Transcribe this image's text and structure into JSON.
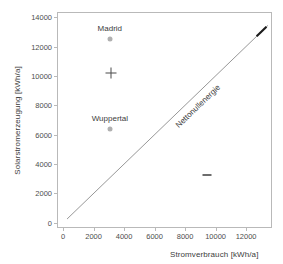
{
  "chart_data": {
    "type": "scatter",
    "title": "",
    "xlabel": "Stromverbrauch [kWh/a]",
    "ylabel": "Solarstromerzeugung [kWh/a]",
    "xlim": [
      -400,
      13700
    ],
    "ylim": [
      -350,
      14350
    ],
    "xticks": [
      0,
      2000,
      4000,
      6000,
      8000,
      10000,
      12000
    ],
    "yticks": [
      0,
      2000,
      4000,
      6000,
      8000,
      10000,
      12000,
      14000
    ],
    "xtick_labels": [
      "0",
      "2000",
      "4000",
      "6000",
      "8000",
      "10000",
      "12000"
    ],
    "ytick_labels": [
      "0",
      "2000",
      "4000",
      "6000",
      "8000",
      "10000",
      "12000",
      "14000"
    ],
    "grid": false,
    "legend": null,
    "points": [
      {
        "name": "madrid",
        "label": "Madrid",
        "x": 3000,
        "y": 12560,
        "marker": "circle",
        "color": "#b0b0b0",
        "label_dx": 0,
        "label_dy": -6
      },
      {
        "name": "unlabeled-plus",
        "label": "",
        "x": 3050,
        "y": 10240,
        "marker": "plus",
        "color": "#4a4a4a",
        "label_dx": 0,
        "label_dy": 0
      },
      {
        "name": "wuppertal",
        "label": "Wuppertal",
        "x": 3000,
        "y": 6450,
        "marker": "circle",
        "color": "#b0b0b0",
        "label_dx": 0,
        "label_dy": -6
      },
      {
        "name": "unlabeled-dash",
        "label": "",
        "x": 9400,
        "y": 3320,
        "marker": "dash",
        "color": "#6d6d6d",
        "label_dx": 0,
        "label_dy": 0
      }
    ],
    "reference_line": {
      "name": "net-zero-energy-line",
      "label": "Nettonullenergie",
      "from": [
        200,
        200
      ],
      "to": [
        13500,
        13500
      ],
      "color": "#8a8a8a",
      "label_position_x": 7200
    },
    "highlight_segment": {
      "name": "line-end-highlight",
      "from": [
        12750,
        12750
      ],
      "to": [
        13400,
        13400
      ],
      "color": "#1c1c1c"
    }
  }
}
